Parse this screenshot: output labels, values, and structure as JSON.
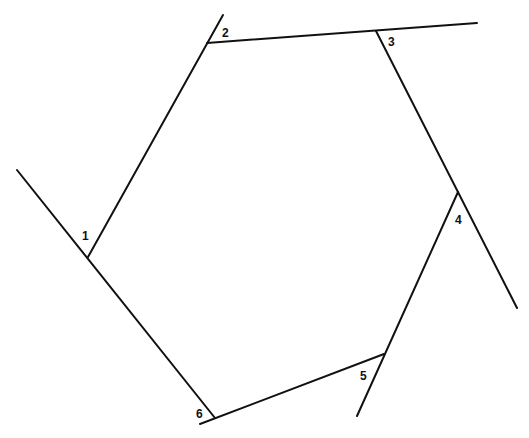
{
  "diagram": {
    "type": "exterior-angles-hexagon",
    "stroke_color": "#111111",
    "background": "#ffffff",
    "vertices": [
      {
        "id": "1",
        "x": 88,
        "y": 257
      },
      {
        "id": "2",
        "x": 207,
        "y": 43
      },
      {
        "id": "3",
        "x": 376,
        "y": 31
      },
      {
        "id": "4",
        "x": 458,
        "y": 192
      },
      {
        "id": "5",
        "x": 384,
        "y": 354
      },
      {
        "id": "6",
        "x": 215,
        "y": 418
      }
    ],
    "extended_lines": [
      {
        "name": "line-6-1",
        "x1": 215,
        "y1": 418,
        "x2": 17,
        "y2": 170
      },
      {
        "name": "line-1-2",
        "x1": 88,
        "y1": 257,
        "x2": 223,
        "y2": 15
      },
      {
        "name": "line-2-3",
        "x1": 207,
        "y1": 43,
        "x2": 477,
        "y2": 23
      },
      {
        "name": "line-3-4",
        "x1": 376,
        "y1": 31,
        "x2": 517,
        "y2": 308
      },
      {
        "name": "line-4-5",
        "x1": 458,
        "y1": 192,
        "x2": 357,
        "y2": 416
      },
      {
        "name": "line-5-6",
        "x1": 384,
        "y1": 354,
        "x2": 200,
        "y2": 424
      }
    ],
    "labels": [
      {
        "text": "1",
        "x": 82,
        "y": 240
      },
      {
        "text": "2",
        "x": 222,
        "y": 37
      },
      {
        "text": "3",
        "x": 388,
        "y": 46
      },
      {
        "text": "4",
        "x": 455,
        "y": 224
      },
      {
        "text": "5",
        "x": 360,
        "y": 380
      },
      {
        "text": "6",
        "x": 196,
        "y": 418
      }
    ]
  }
}
